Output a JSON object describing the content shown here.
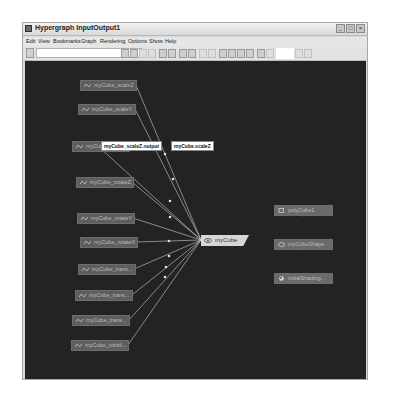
{
  "window": {
    "title": "Hypergraph InputOutput1",
    "controls": {
      "minimize": "_",
      "maximize": "□",
      "close": "×"
    }
  },
  "menu": [
    "Edit",
    "View",
    "Bookmarks",
    "Graph",
    "Rendering",
    "Options",
    "Show",
    "Help"
  ],
  "toolbar": {
    "search_value": "",
    "icons": [
      "frame-all-icon",
      "frame-selection-icon",
      "previous-view-icon",
      "next-view-icon",
      "graph-up-icon",
      "graph-down-icon",
      "bookmark-icon",
      "create-bookmark-icon",
      "dependency-graph-icon",
      "scene-hierarchy-icon",
      "input-output-connections-icon",
      "input-connections-icon",
      "output-connections-icon",
      "clear-view-icon",
      "swatch-icon",
      "list-icon",
      "layout-simple-icon",
      "layout-grid-icon"
    ]
  },
  "graph": {
    "input_nodes": [
      {
        "label": "myCube_scale2"
      },
      {
        "label": "myCube_scaleY"
      },
      {
        "label": "myCube_scaleZ"
      },
      {
        "label": "myCube_rotateZ"
      },
      {
        "label": "myCube_rotateY"
      },
      {
        "label": "myCube_rotateX"
      },
      {
        "label": "myCube_trans..."
      },
      {
        "label": "myCube_trans..."
      },
      {
        "label": "myCube_trans..."
      },
      {
        "label": "myCube_visibil..."
      }
    ],
    "center_node": {
      "label": "myCube"
    },
    "output_nodes": [
      {
        "label": "polyCube1"
      },
      {
        "label": "myCubeShape"
      },
      {
        "label": "initialShading..."
      }
    ],
    "tooltips": {
      "source": "myCube_scaleZ.output",
      "destination": "myCube.scaleZ"
    }
  },
  "status": {
    "text": "Traversal Depth: Unlimited"
  },
  "colors": {
    "canvas_bg": "#232323",
    "node_bg": "#5e5e5e",
    "center_node_bg": "#d6d6d6",
    "edge": "#cfcfcf"
  }
}
